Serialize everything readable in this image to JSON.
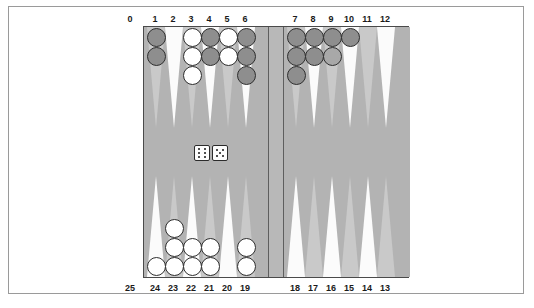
{
  "app": {
    "title": "Backgammon Board",
    "board_bg_color": "#b3b3b3",
    "point_light_color": "#fbfbfb",
    "point_dark_color": "#c9c9c9",
    "bar_color": "#b8b8b8",
    "frame_color": "#9a9a9a",
    "dark_checker_color": "#8e8e8e",
    "light_checker_color": "#ffffff"
  },
  "top_numbers": [
    "0",
    "1",
    "2",
    "3",
    "4",
    "5",
    "6",
    "7",
    "8",
    "9",
    "10",
    "11",
    "12"
  ],
  "bottom_numbers": [
    "25",
    "24",
    "23",
    "22",
    "21",
    "20",
    "19",
    "18",
    "17",
    "16",
    "15",
    "14",
    "13"
  ],
  "dice": {
    "label": "dice",
    "values": [
      6,
      5
    ],
    "die_1_value": "6",
    "die_2_value": "5"
  },
  "points": [
    {
      "number": "1",
      "row": "top",
      "quadrant": "left",
      "checkers": 2,
      "color": "dark"
    },
    {
      "number": "2",
      "row": "top",
      "quadrant": "left",
      "checkers": 0,
      "color": "none"
    },
    {
      "number": "3",
      "row": "top",
      "quadrant": "left",
      "checkers": 3,
      "color": "light"
    },
    {
      "number": "4",
      "row": "top",
      "quadrant": "left",
      "checkers": 2,
      "color": "dark"
    },
    {
      "number": "5",
      "row": "top",
      "quadrant": "left",
      "checkers": 2,
      "color": "light"
    },
    {
      "number": "6",
      "row": "top",
      "quadrant": "left",
      "checkers": 3,
      "color": "dark"
    },
    {
      "number": "7",
      "row": "top",
      "quadrant": "right",
      "checkers": 3,
      "color": "dark"
    },
    {
      "number": "8",
      "row": "top",
      "quadrant": "right",
      "checkers": 2,
      "color": "dark"
    },
    {
      "number": "9",
      "row": "top",
      "quadrant": "right",
      "checkers": 2,
      "color": "dark"
    },
    {
      "number": "10",
      "row": "top",
      "quadrant": "right",
      "checkers": 1,
      "color": "dark"
    },
    {
      "number": "11",
      "row": "top",
      "quadrant": "right",
      "checkers": 0,
      "color": "none"
    },
    {
      "number": "12",
      "row": "top",
      "quadrant": "right",
      "checkers": 0,
      "color": "none"
    },
    {
      "number": "13",
      "row": "bottom",
      "quadrant": "right",
      "checkers": 0,
      "color": "none"
    },
    {
      "number": "14",
      "row": "bottom",
      "quadrant": "right",
      "checkers": 0,
      "color": "none"
    },
    {
      "number": "15",
      "row": "bottom",
      "quadrant": "right",
      "checkers": 0,
      "color": "none"
    },
    {
      "number": "16",
      "row": "bottom",
      "quadrant": "right",
      "checkers": 0,
      "color": "none"
    },
    {
      "number": "17",
      "row": "bottom",
      "quadrant": "right",
      "checkers": 0,
      "color": "none"
    },
    {
      "number": "18",
      "row": "bottom",
      "quadrant": "right",
      "checkers": 0,
      "color": "none"
    },
    {
      "number": "19",
      "row": "bottom",
      "quadrant": "left",
      "checkers": 2,
      "color": "light"
    },
    {
      "number": "20",
      "row": "bottom",
      "quadrant": "left",
      "checkers": 0,
      "color": "none"
    },
    {
      "number": "21",
      "row": "bottom",
      "quadrant": "left",
      "checkers": 2,
      "color": "light"
    },
    {
      "number": "22",
      "row": "bottom",
      "quadrant": "left",
      "checkers": 2,
      "color": "light"
    },
    {
      "number": "23",
      "row": "bottom",
      "quadrant": "left",
      "checkers": 3,
      "color": "light"
    },
    {
      "number": "24",
      "row": "bottom",
      "quadrant": "left",
      "checkers": 1,
      "color": "light"
    }
  ]
}
